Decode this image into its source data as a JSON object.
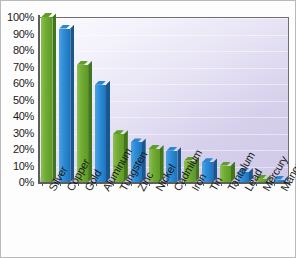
{
  "chart_data": {
    "type": "bar",
    "title": "",
    "subtitle": "",
    "xlabel": "",
    "ylabel": "",
    "ylim": [
      0,
      100
    ],
    "ytick_labels": [
      "100%",
      "90%",
      "80%",
      "70%",
      "60%",
      "50%",
      "40%",
      "30%",
      "20%",
      "10%",
      "0%"
    ],
    "ytick_values": [
      100,
      90,
      80,
      70,
      60,
      50,
      40,
      30,
      20,
      10,
      0
    ],
    "grid": true,
    "legend": "none",
    "categories": [
      "Silver",
      "Copper",
      "Gold",
      "Aluminum",
      "Tungsten",
      "Zinc",
      "Nickel",
      "Cadmium",
      "Iron",
      "Tin",
      "Tantalum",
      "Lead",
      "Mercury",
      "Manganese"
    ],
    "values": [
      100,
      93,
      71,
      59,
      29,
      24,
      20,
      19,
      13,
      12,
      10,
      6,
      2,
      1.5
    ],
    "bar_colors": [
      "green",
      "blue",
      "green",
      "blue",
      "green",
      "blue",
      "green",
      "blue",
      "green",
      "blue",
      "green",
      "blue",
      "green",
      "blue"
    ],
    "series": [
      {
        "name": "Recycling rate",
        "values": [
          100,
          93,
          71,
          59,
          29,
          24,
          20,
          19,
          13,
          12,
          10,
          6,
          2,
          1.5
        ]
      }
    ]
  },
  "palette": {
    "green": "#6aa530",
    "blue": "#2e8fd8",
    "plot_background_light": "#fbfbfe",
    "plot_background_dark": "#cfc8e8",
    "axis": "#5d5d5d",
    "text": "#1a1a1a",
    "frame_border": "#b9b9b9"
  }
}
